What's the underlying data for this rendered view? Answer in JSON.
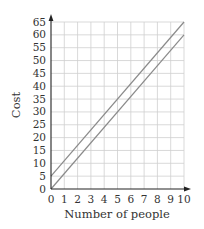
{
  "chart_data": {
    "type": "line",
    "title": "",
    "xlabel": "Number of people",
    "ylabel": "Cost",
    "xlim": [
      0,
      10
    ],
    "ylim": [
      0,
      65
    ],
    "x_ticks": [
      0,
      1,
      2,
      3,
      4,
      5,
      6,
      7,
      8,
      9,
      10
    ],
    "y_ticks": [
      0,
      5,
      10,
      15,
      20,
      25,
      30,
      35,
      40,
      45,
      50,
      55,
      60,
      65
    ],
    "grid": true,
    "legend": null,
    "series": [
      {
        "name": "Line A",
        "x": [
          0,
          10
        ],
        "y": [
          5,
          65
        ],
        "color": "#8a8a8a"
      },
      {
        "name": "Line B",
        "x": [
          0,
          10
        ],
        "y": [
          0,
          60
        ],
        "color": "#8a8a8a"
      }
    ],
    "colors": {
      "grid": "#cfcfcf",
      "axis": "#222222",
      "text": "#333333"
    }
  }
}
